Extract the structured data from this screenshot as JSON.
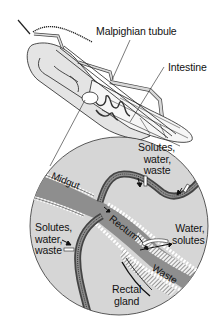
{
  "diagram": {
    "labels": {
      "malpighian_tubule": "Malpighian tubule",
      "intestine": "Intestine",
      "solutes_top": "Solutes,\n  water,\n  waste",
      "midgut": "Midgut",
      "rectum": "Rectum",
      "solutes_left": "Solutes,\nwater,\nwaste",
      "water_solutes": "Water,\nsolutes",
      "waste": "Waste",
      "rectal_gland": "Rectal\ngland"
    },
    "colors": {
      "background": "#ffffff",
      "circle_fill": "#d6d6d6",
      "gut_fill": "#8e8e8e",
      "outline": "#222222",
      "insect_fill": "#e4e4e4",
      "hatch": "#555555"
    }
  }
}
